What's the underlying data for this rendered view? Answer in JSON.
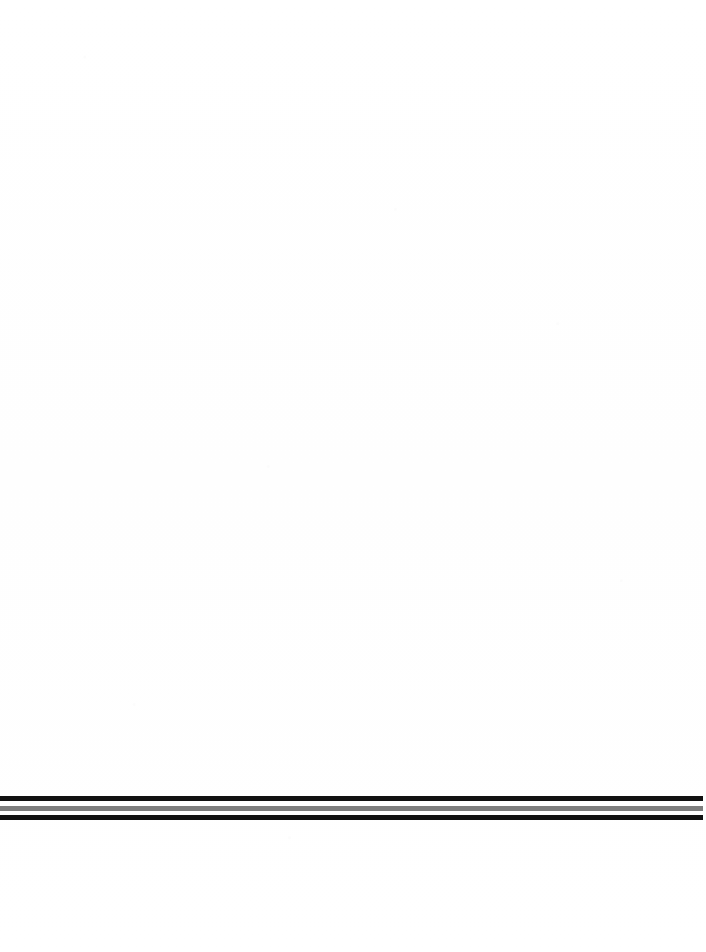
{
  "page": {
    "label": "scanned-page",
    "width": 706,
    "height": 952,
    "background_color": "#ffffff",
    "content_text": "",
    "body_text": ""
  },
  "rule_band": {
    "label": "horizontal-rule-band",
    "left": 0,
    "top": 795,
    "width": 703,
    "height": 26,
    "rules": [
      {
        "name": "rule-top-black",
        "color": "#111111",
        "offset_top": 1,
        "thickness": 5,
        "left": 0,
        "width": 703
      },
      {
        "name": "rule-gap-upper-white",
        "color": "#ffffff",
        "offset_top": 6,
        "thickness": 5,
        "left": 0,
        "width": 703
      },
      {
        "name": "rule-middle-gray",
        "color": "#7e7e7e",
        "offset_top": 11,
        "thickness": 5,
        "left": 0,
        "width": 703
      },
      {
        "name": "rule-gap-lower-white",
        "color": "#ffffff",
        "offset_top": 16,
        "thickness": 4,
        "left": 0,
        "width": 703
      },
      {
        "name": "rule-bottom-black",
        "color": "#111111",
        "offset_top": 20,
        "thickness": 5,
        "left": 0,
        "width": 703
      }
    ]
  },
  "footer_area": {
    "label": "footer-blank-area",
    "text": ""
  },
  "colors": {
    "ink_black": "#111111",
    "ink_gray": "#7e7e7e",
    "paper_white": "#ffffff"
  }
}
